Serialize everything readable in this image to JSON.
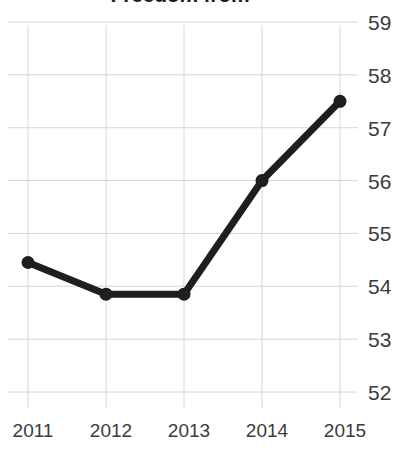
{
  "chart_data": {
    "type": "line",
    "title": "Freedom from",
    "xlabel": "",
    "ylabel": "",
    "categories": [
      "2011",
      "2012",
      "2013",
      "2014",
      "2015"
    ],
    "x": [
      2011,
      2012,
      2013,
      2014,
      2015
    ],
    "values": [
      54.45,
      53.85,
      53.85,
      56.0,
      57.5
    ],
    "series": [
      {
        "name": "Freedom from",
        "values": [
          54.45,
          53.85,
          53.85,
          56.0,
          57.5
        ]
      }
    ],
    "ylim": [
      52,
      59
    ],
    "xlim": [
      2011,
      2015
    ],
    "yticks": [
      59,
      58,
      57,
      56,
      55,
      54,
      53,
      52
    ],
    "ytick_labels": [
      "59",
      "58",
      "57",
      "56",
      "55",
      "54",
      "53",
      "52"
    ],
    "xticks": [
      2011,
      2012,
      2013,
      2014,
      2015
    ],
    "xtick_labels": [
      "2011",
      "2012",
      "2013",
      "2014",
      "2015"
    ],
    "grid": true,
    "legend": false,
    "legend_position": "none",
    "marker": "circle",
    "line_color": "#1e1e1e",
    "marker_color": "#1e1e1e",
    "grid_color": "#d6d6d6",
    "tick_label_color": "#3b3b3b",
    "title_color": "#1d1d1d",
    "background_color": "#ffffff",
    "y_axis_side": "right"
  }
}
